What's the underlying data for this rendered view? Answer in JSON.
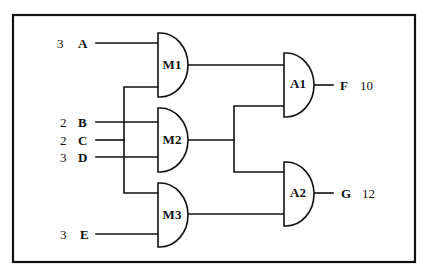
{
  "diagram": {
    "type": "logic-circuit",
    "inputs": [
      {
        "name": "A",
        "value": "3"
      },
      {
        "name": "B",
        "value": "2"
      },
      {
        "name": "C",
        "value": "2"
      },
      {
        "name": "D",
        "value": "3"
      },
      {
        "name": "E",
        "value": "3"
      }
    ],
    "gates": [
      {
        "id": "M1",
        "label": "M1"
      },
      {
        "id": "M2",
        "label": "M2"
      },
      {
        "id": "M3",
        "label": "M3"
      },
      {
        "id": "A1",
        "label": "A1"
      },
      {
        "id": "A2",
        "label": "A2"
      }
    ],
    "outputs": [
      {
        "name": "F",
        "value": "10"
      },
      {
        "name": "G",
        "value": "12"
      }
    ],
    "connections": [
      {
        "from": "A",
        "to": "M1"
      },
      {
        "from": "C",
        "to": "M1"
      },
      {
        "from": "C",
        "to": "M3"
      },
      {
        "from": "B",
        "to": "M2"
      },
      {
        "from": "D",
        "to": "M2"
      },
      {
        "from": "E",
        "to": "M3"
      },
      {
        "from": "M1",
        "to": "A1"
      },
      {
        "from": "M2",
        "to": "A1"
      },
      {
        "from": "M2",
        "to": "A2"
      },
      {
        "from": "M3",
        "to": "A2"
      },
      {
        "from": "A1",
        "to": "F"
      },
      {
        "from": "A2",
        "to": "G"
      }
    ]
  }
}
